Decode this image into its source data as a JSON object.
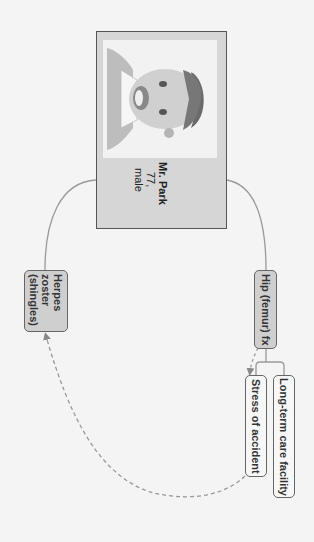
{
  "diagram": {
    "orientation": "rotated 90deg clockwise",
    "patient": {
      "name": "Mr. Park",
      "age": "77,",
      "sex": "male",
      "photo": "patient-portrait-illustration"
    },
    "nodes": {
      "hip": {
        "label": "Hip (femur) fx",
        "style": "filled"
      },
      "long_term": {
        "label": "Long-term care facility",
        "style": "outline"
      },
      "stress": {
        "label": "Stress of accident",
        "style": "outline"
      },
      "herpes": {
        "line1": "Herpes",
        "line2": "zoster",
        "line3": "(shingles)",
        "style": "filled"
      }
    },
    "edges": [
      {
        "from": "patient",
        "to": "hip",
        "type": "solid"
      },
      {
        "from": "patient",
        "to": "herpes",
        "type": "solid"
      },
      {
        "from": "hip",
        "to": "long_term",
        "type": "solid-bracket"
      },
      {
        "from": "hip",
        "to": "stress",
        "type": "solid-bracket"
      },
      {
        "from": "hip",
        "to": "stress",
        "type": "dashed-arrow"
      },
      {
        "from": "stress",
        "to": "herpes",
        "type": "dashed-arrow"
      }
    ],
    "colors": {
      "background": "#f4f4f4",
      "card": "#d6d6d6",
      "filled_node": "#cfcfcf",
      "line": "#888888",
      "border": "#555555"
    }
  }
}
